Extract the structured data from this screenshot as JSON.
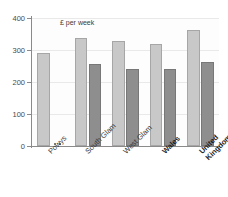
{
  "chart_data": {
    "type": "bar",
    "title": "",
    "subtitle": "",
    "annotation": "£ per week",
    "xlabel": "",
    "ylabel": "",
    "ylim": [
      0,
      400
    ],
    "yticks": [
      0,
      100,
      200,
      300,
      400
    ],
    "ytick_labels": [
      "0",
      "100",
      "200",
      "300",
      "400"
    ],
    "grid": true,
    "legend": "none",
    "categories": [
      "Powys",
      "South Glam",
      "West Glam",
      "Wales",
      "United\nKingdom"
    ],
    "category_bold": [
      false,
      false,
      false,
      true,
      true
    ],
    "series": [
      {
        "name": "series-1",
        "color": "#c8c8c8",
        "values": [
          290,
          338,
          328,
          320,
          362
        ]
      },
      {
        "name": "series-2",
        "color": "#8e8e8e",
        "values": [
          0,
          256,
          240,
          240,
          262
        ]
      }
    ],
    "colors": {
      "series_light": "#c8c8c8",
      "series_dark": "#8e8e8e",
      "axis": "#8a8a8a",
      "grid": "#e9e9e9",
      "background": "#fdfdfd",
      "text": "#3a3a3a"
    }
  }
}
